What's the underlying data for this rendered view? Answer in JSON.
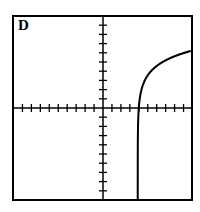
{
  "panel": {
    "label": "D"
  },
  "chart_data": {
    "type": "line",
    "title": "D",
    "xlabel": "",
    "ylabel": "",
    "grid": false,
    "axes": "centered crosshair with tick marks",
    "xlim": [
      -10,
      10
    ],
    "ylim": [
      -10,
      10
    ],
    "tick_interval": 1,
    "series": [
      {
        "name": "curve",
        "description": "logarithmic-type curve with vertical asymptote near x=3.9, crossing x-axis near x=4, rising and leveling off toward the right edge",
        "x": [
          3.9,
          3.95,
          4.0,
          4.3,
          5.0,
          6.0,
          7.0,
          8.0,
          9.0,
          9.8
        ],
        "y": [
          -10,
          -4.0,
          0.0,
          2.0,
          3.5,
          4.6,
          5.2,
          5.6,
          5.9,
          6.2
        ]
      }
    ]
  }
}
